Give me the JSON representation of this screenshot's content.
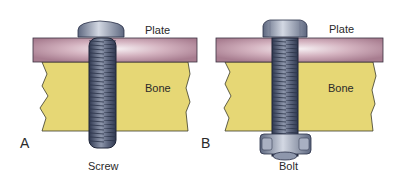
{
  "panels": [
    {
      "id": "A",
      "panel_label": "A",
      "plate_label": "Plate",
      "bone_label": "Bone",
      "fastener_label": "Screw"
    },
    {
      "id": "B",
      "panel_label": "B",
      "plate_label": "Plate",
      "bone_label": "Bone",
      "fastener_label": "Bolt"
    }
  ],
  "colors": {
    "plate": "#c9a3b2",
    "plate_highlight": "#f4eef2",
    "bone": "#e6d775",
    "metal_dark": "#4a5570",
    "metal_light": "#c4cad8",
    "outline": "#2e2e2e"
  }
}
